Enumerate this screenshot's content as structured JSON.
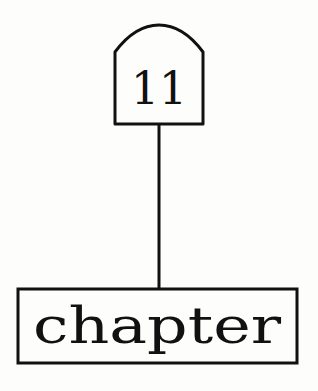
{
  "diagram": {
    "type": "tree",
    "nodes": [
      {
        "id": "top",
        "label": "11",
        "shape": "arched-tab"
      },
      {
        "id": "bottom",
        "label": "chapter",
        "shape": "rectangle"
      }
    ],
    "edges": [
      {
        "from": "top",
        "to": "bottom"
      }
    ],
    "colors": {
      "stroke": "#111111",
      "background": "#fdfdfb"
    }
  }
}
